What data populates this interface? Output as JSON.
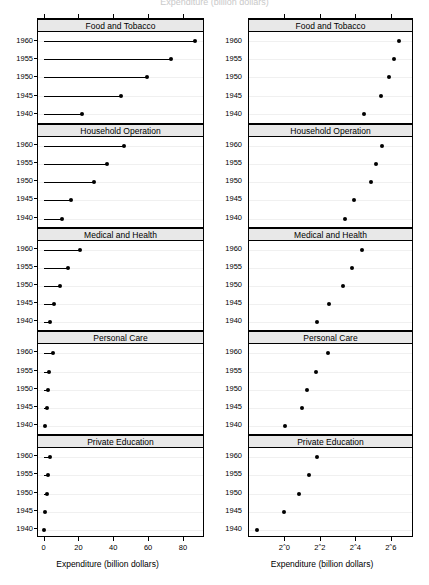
{
  "figure": {
    "clipped_title": "Expenditure (billion dollars)",
    "panel_labels": [
      "Food and Tobacco",
      "Household Operation",
      "Medical and Health",
      "Personal Care",
      "Private Education"
    ],
    "year_labels": [
      "1960",
      "1955",
      "1950",
      "1945",
      "1940"
    ]
  },
  "left_axis": {
    "xlabel": "Expenditure (billion dollars)",
    "ticks": [
      "0",
      "20",
      "40",
      "60",
      "80"
    ],
    "tick_values": [
      0,
      20,
      40,
      60,
      80
    ]
  },
  "right_axis": {
    "xlabel": "Expenditure (billion dollars)",
    "ticks": [
      "2^0",
      "2^2",
      "2^4",
      "2^6"
    ],
    "tick_values": [
      0,
      2,
      4,
      6
    ]
  },
  "chart_data": {
    "type": "scatter",
    "title": "",
    "xlabel": "Expenditure (billion dollars)",
    "ylabel": "",
    "categories": [
      "1960",
      "1955",
      "1950",
      "1945",
      "1940"
    ],
    "legend": [],
    "grid": true,
    "panels": [
      {
        "name": "Food and Tobacco",
        "x": [
          86.8,
          73.2,
          59.6,
          44.5,
          22.2
        ],
        "y": [
          "1960",
          "1955",
          "1950",
          "1945",
          "1940"
        ]
      },
      {
        "name": "Household Operation",
        "x": [
          46.2,
          36.5,
          29.0,
          15.5,
          10.5
        ],
        "y": [
          "1960",
          "1955",
          "1950",
          "1945",
          "1940"
        ]
      },
      {
        "name": "Medical and Health",
        "x": [
          21.1,
          14.0,
          9.71,
          5.76,
          3.53
        ],
        "y": [
          "1960",
          "1955",
          "1950",
          "1945",
          "1940"
        ]
      },
      {
        "name": "Personal Care",
        "x": [
          5.4,
          3.4,
          2.45,
          1.98,
          1.04
        ],
        "y": [
          "1960",
          "1955",
          "1950",
          "1945",
          "1940"
        ]
      },
      {
        "name": "Private Education",
        "x": [
          3.64,
          2.6,
          1.8,
          0.974,
          0.341
        ],
        "y": [
          "1960",
          "1955",
          "1950",
          "1945",
          "1940"
        ]
      }
    ],
    "left_panel": {
      "scale": "linear",
      "xlim": [
        -3.2,
        91.5
      ],
      "style": "dotplot-with-droplines"
    },
    "right_panel": {
      "scale": "log2",
      "xlim": [
        -2.0,
        7.2
      ],
      "style": "dotplot-points-only"
    }
  },
  "colors": {
    "ink": "#000000",
    "strip_background": "#e8e8e8",
    "reference_line": "#f0f0f0",
    "page_background": "#ffffff"
  }
}
